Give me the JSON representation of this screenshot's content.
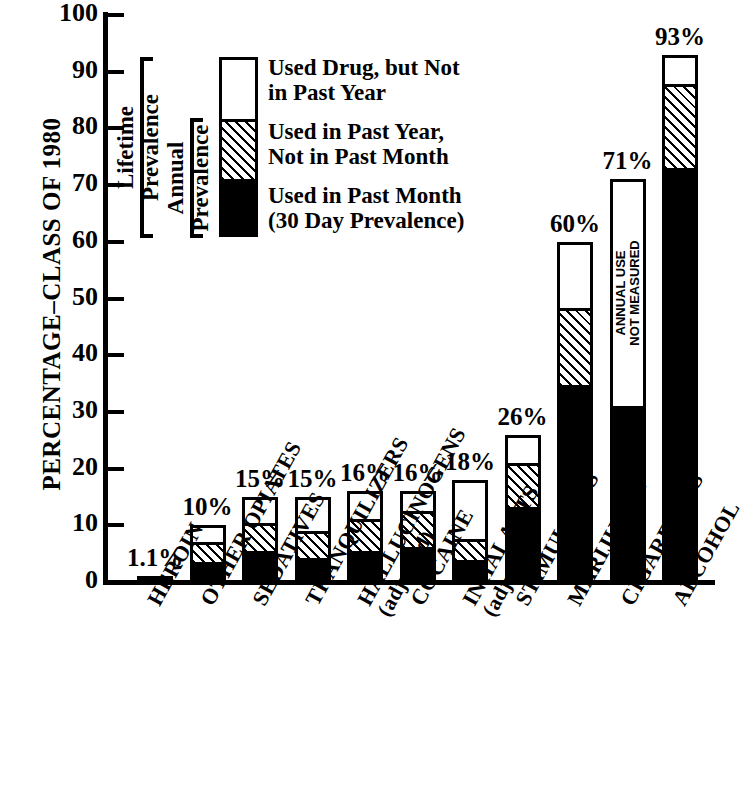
{
  "chart_data": {
    "type": "bar",
    "stacked": true,
    "title": "",
    "xlabel": "",
    "ylabel": "PERCENTAGE–CLASS OF 1980",
    "ylim": [
      0,
      100
    ],
    "yticks": [
      0,
      10,
      20,
      30,
      40,
      50,
      60,
      70,
      80,
      90,
      100
    ],
    "grid": false,
    "legend_position": "upper-left-inset",
    "categories": [
      "HEROIN",
      "OTHER OPIATES",
      "SEDATIVES",
      "TRANQUILIZERS",
      "HALLUCINOGENS (adjusted)",
      "COCAINE",
      "INHALANTS (adjusted)",
      "STIMULANTS",
      "MARIJUANA",
      "CIGARETTES",
      "ALCOHOL"
    ],
    "series": [
      {
        "name": "Used in Past Month (30 Day Prevalence)",
        "key": "past_month",
        "fill": "solid-black",
        "values": [
          0.2,
          2.4,
          4.4,
          3.1,
          4.4,
          5.2,
          2.9,
          12.1,
          33.7,
          30.5,
          72.0
        ]
      },
      {
        "name": "Used in Past Year, Not in Past Month",
        "key": "past_year_not_month",
        "fill": "diagonal-hatch",
        "values": [
          0.3,
          4.1,
          5.4,
          5.4,
          6.2,
          6.8,
          4.2,
          8.3,
          14.1,
          0,
          15.3
        ]
      },
      {
        "name": "Used Drug, but Not in Past Year",
        "key": "not_past_year",
        "fill": "white",
        "values": [
          0.6,
          3.5,
          5.2,
          6.5,
          5.4,
          4.0,
          10.9,
          5.6,
          12.2,
          40.5,
          5.7
        ]
      }
    ],
    "totals": [
      1.1,
      10,
      15,
      15,
      16,
      16,
      18,
      26,
      60,
      71,
      93
    ],
    "value_labels": [
      "1.1%",
      "10%",
      "15%",
      "15%",
      "16%",
      "16%",
      "18%",
      "26%",
      "60%",
      "71%",
      "93%"
    ],
    "annotations": [
      {
        "category": "CIGARETTES",
        "text": "ANNUAL USE\nNOT MEASURED",
        "orientation": "vertical"
      }
    ]
  },
  "axis": {
    "y_title": "PERCENTAGE–CLASS OF 1980",
    "tick_labels": [
      "100",
      "90",
      "80",
      "70",
      "60",
      "50",
      "40",
      "30",
      "20",
      "10",
      "0"
    ]
  },
  "legend": {
    "items": [
      {
        "swatch": "white",
        "label": "Used Drug, but Not\nin Past Year"
      },
      {
        "swatch": "hatch",
        "label": "Used in Past Year,\nNot in Past Month"
      },
      {
        "swatch": "black",
        "label": "Used in Past Month\n(30 Day Prevalence)"
      }
    ],
    "brackets": [
      {
        "label": "Lifetime\nPrevalence"
      },
      {
        "label": "Annual\nPrevalence"
      }
    ]
  },
  "x_labels": [
    {
      "main": "HEROIN",
      "sub": ""
    },
    {
      "main": "OTHER OPIATES",
      "sub": ""
    },
    {
      "main": "SEDATIVES",
      "sub": ""
    },
    {
      "main": "TRANQUILIZERS",
      "sub": ""
    },
    {
      "main": "HALLUCINOGENS",
      "sub": "(adjusted)"
    },
    {
      "main": "COCAINE",
      "sub": ""
    },
    {
      "main": "INHALANTS",
      "sub": "(adjusted)"
    },
    {
      "main": "STIMULANTS",
      "sub": ""
    },
    {
      "main": "MARIJUANA",
      "sub": ""
    },
    {
      "main": "CIGARETTES",
      "sub": ""
    },
    {
      "main": "ALCOHOL",
      "sub": ""
    }
  ],
  "colors": {
    "ink": "#000000",
    "paper": "#ffffff"
  }
}
